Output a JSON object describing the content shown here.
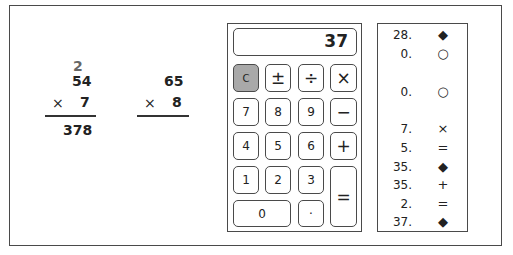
{
  "worksheet": {
    "problem1": {
      "carry": "2",
      "multiplicand": "54",
      "operator": "×",
      "multiplier": "7",
      "product": "378"
    },
    "problem2": {
      "multiplicand": "65",
      "operator": "×",
      "multiplier": "8",
      "product": ""
    }
  },
  "calculator": {
    "display": "37",
    "keys": {
      "clear": "C",
      "plusminus": "±",
      "divide": "÷",
      "multiply": "×",
      "k7": "7",
      "k8": "8",
      "k9": "9",
      "minus": "−",
      "k4": "4",
      "k5": "5",
      "k6": "6",
      "plus": "+",
      "k1": "1",
      "k2": "2",
      "k3": "3",
      "equals": "=",
      "k0": "0",
      "decimal": "·"
    },
    "clear_color": "#a9a9a9"
  },
  "tape": {
    "entries": [
      {
        "value": "28.",
        "symbol": "◆"
      },
      {
        "value": "0.",
        "symbol": "○"
      },
      {
        "value": "0.",
        "symbol": "○"
      },
      {
        "value": "7.",
        "symbol": "×"
      },
      {
        "value": "5.",
        "symbol": "="
      },
      {
        "value": "35.",
        "symbol": "◆"
      },
      {
        "value": "35.",
        "symbol": "+"
      },
      {
        "value": "2.",
        "symbol": "="
      },
      {
        "value": "37.",
        "symbol": "◆"
      }
    ]
  }
}
